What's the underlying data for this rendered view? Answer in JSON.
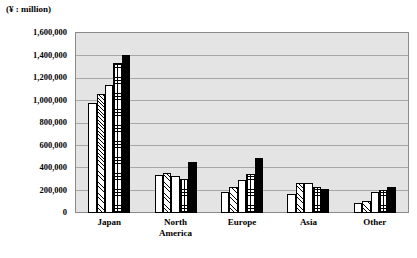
{
  "chart_data": {
    "type": "bar",
    "title": "",
    "subtitle": "",
    "unit_caption": "(¥ : million)",
    "xlabel": "",
    "ylabel": "",
    "categories": [
      "Japan",
      "North America",
      "Europe",
      "Asia",
      "Other"
    ],
    "category_lines": [
      [
        "Japan"
      ],
      [
        "North",
        "America"
      ],
      [
        "Europe"
      ],
      [
        "Asia"
      ],
      [
        "Other"
      ]
    ],
    "series": [
      {
        "name": "Series 1",
        "fill": "plain",
        "values": [
          980000,
          340000,
          190000,
          165000,
          85000
        ]
      },
      {
        "name": "Series 2",
        "fill": "diag",
        "values": [
          1060000,
          355000,
          235000,
          265000,
          110000
        ]
      },
      {
        "name": "Series 3",
        "fill": "plain2",
        "values": [
          1140000,
          330000,
          290000,
          270000,
          185000
        ]
      },
      {
        "name": "Series 4",
        "fill": "grid",
        "values": [
          1330000,
          305000,
          350000,
          230000,
          205000
        ]
      },
      {
        "name": "Series 5",
        "fill": "solid",
        "values": [
          1405000,
          450000,
          490000,
          215000,
          235000
        ]
      }
    ],
    "ylim": [
      0,
      1600000
    ],
    "ytick_values": [
      1600000,
      1400000,
      1200000,
      1000000,
      800000,
      600000,
      400000,
      200000,
      0
    ],
    "ytick_labels": [
      "1,600,000",
      "1,400,000",
      "1,200,000",
      "1,000,000",
      "800,000",
      "600,000",
      "400,000",
      "200,000",
      "0"
    ],
    "grid": true,
    "grid_axis": "y",
    "legend": "none",
    "plot_background": "#e4e4e4",
    "border_color": "#8a8a8a",
    "gridline_color": "#a8a8a8"
  }
}
